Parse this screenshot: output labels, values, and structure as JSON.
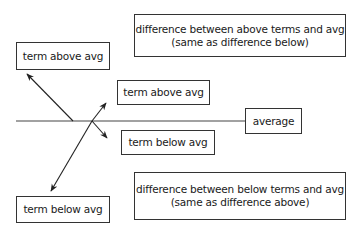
{
  "diagram": {
    "type": "deviation-from-average",
    "nodes": {
      "term_above_left": "term above avg",
      "term_above_mid": "term above avg",
      "term_below_mid": "term below avg",
      "term_below_left": "term below avg",
      "average": "average",
      "diff_above_line1": "difference between above terms and avg",
      "diff_above_line2": "(same as difference below)",
      "diff_below_line1": "difference between below terms and avg",
      "diff_below_line2": "(same as difference above)"
    },
    "colors": {
      "stroke": "#333333",
      "background": "#ffffff",
      "text": "#1a1a1a"
    }
  }
}
